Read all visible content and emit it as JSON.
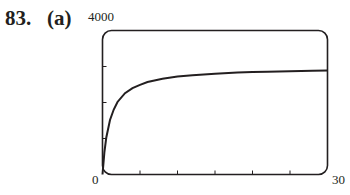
{
  "header": {
    "problem_number": "83.",
    "part_label": "(a)"
  },
  "axes": {
    "y_max_label": "4000",
    "x_min_label": "0",
    "x_max_label": "30"
  },
  "colors": {
    "ink": "#231f20",
    "background": "#ffffff"
  },
  "chart_data": {
    "type": "line",
    "xlabel": "",
    "ylabel": "",
    "xlim": [
      0,
      30
    ],
    "ylim": [
      0,
      4000
    ],
    "x_ticks": [
      0,
      5,
      10,
      15,
      20,
      25,
      30
    ],
    "y_ticks": [
      0,
      1000,
      2000,
      3000,
      4000
    ],
    "tick_labels_shown": {
      "x": [
        "0",
        "30"
      ],
      "y": [
        "4000"
      ]
    },
    "grid": false,
    "legend": null,
    "frame": "rounded-rectangle",
    "series": [
      {
        "name": "curve",
        "x": [
          0,
          0.25,
          0.5,
          1,
          1.5,
          2,
          3,
          4,
          5,
          6,
          8,
          10,
          12,
          15,
          18,
          20,
          22,
          25,
          28,
          30
        ],
        "y": [
          0,
          615,
          1020,
          1515,
          1805,
          2015,
          2260,
          2400,
          2490,
          2570,
          2660,
          2720,
          2760,
          2800,
          2830,
          2845,
          2855,
          2870,
          2880,
          2890
        ]
      }
    ]
  }
}
